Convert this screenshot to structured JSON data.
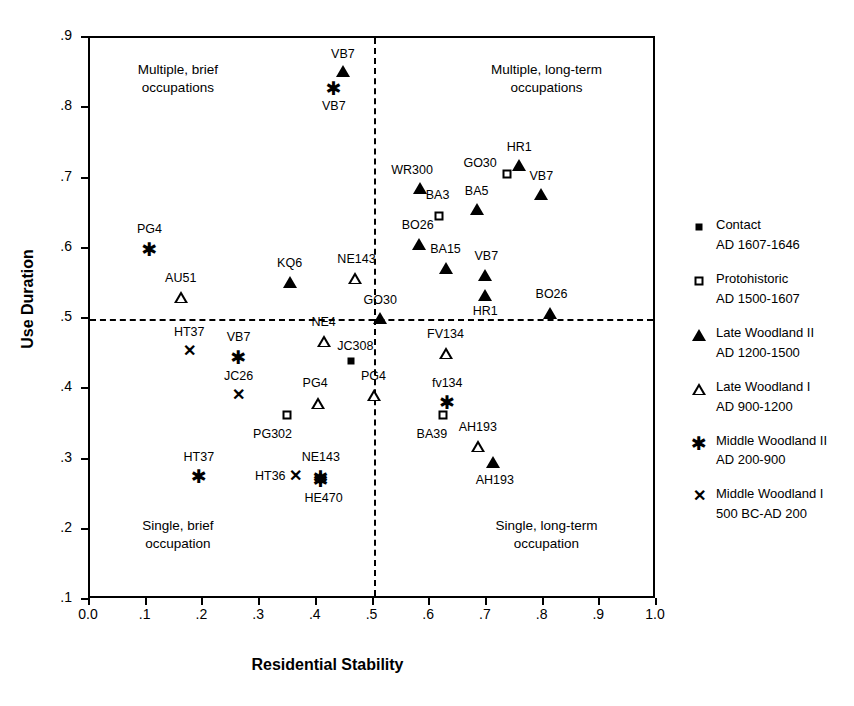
{
  "chart_data": {
    "type": "scatter",
    "title": "",
    "xlabel": "Residential Stability",
    "ylabel": "Use Duration",
    "xlim": [
      0.0,
      1.0
    ],
    "ylim": [
      0.1,
      0.9
    ],
    "grid": false,
    "xticks": [
      "0.0",
      ".1",
      ".2",
      ".3",
      ".4",
      ".5",
      ".6",
      ".7",
      ".8",
      ".9",
      "1.0"
    ],
    "xtick_values": [
      0.0,
      0.1,
      0.2,
      0.3,
      0.4,
      0.5,
      0.6,
      0.7,
      0.8,
      0.9,
      1.0
    ],
    "yticks": [
      ".1",
      ".2",
      ".3",
      ".4",
      ".5",
      ".6",
      ".7",
      ".8",
      ".9"
    ],
    "ytick_values": [
      0.1,
      0.2,
      0.3,
      0.4,
      0.5,
      0.6,
      0.7,
      0.8,
      0.9
    ],
    "reference_lines": {
      "vertical_x": 0.5,
      "horizontal_y": 0.5,
      "style": "dashed"
    },
    "quadrant_labels": [
      {
        "text": "Multiple, brief\noccupations",
        "x": 0.155,
        "y": 0.845
      },
      {
        "text": "Multiple, long-term\noccupations",
        "x": 0.805,
        "y": 0.845
      },
      {
        "text": "Single, brief\noccupation",
        "x": 0.155,
        "y": 0.195
      },
      {
        "text": "Single, long-term\noccupation",
        "x": 0.805,
        "y": 0.195
      }
    ],
    "legend": {
      "position": "right",
      "entries": [
        {
          "marker": "filled-square",
          "name": "Contact",
          "date": "AD 1607-1646"
        },
        {
          "marker": "open-square",
          "name": "Protohistoric",
          "date": "AD 1500-1607"
        },
        {
          "marker": "filled-triangle",
          "name": "Late Woodland II",
          "date": "AD 1200-1500"
        },
        {
          "marker": "open-triangle",
          "name": "Late Woodland I",
          "date": "AD 900-1200"
        },
        {
          "marker": "asterisk",
          "name": "Middle Woodland II",
          "date": "AD 200-900"
        },
        {
          "marker": "ex",
          "name": "Middle Woodland I",
          "date": "500 BC-AD 200"
        }
      ]
    },
    "points": [
      {
        "label": "VB7",
        "marker": "filled-triangle",
        "x": 0.446,
        "y": 0.853,
        "lx": 0.446,
        "ly": 0.877
      },
      {
        "label": "VB7",
        "marker": "asterisk",
        "x": 0.43,
        "y": 0.829,
        "lx": 0.43,
        "ly": 0.803
      },
      {
        "label": "HR1",
        "marker": "filled-triangle",
        "x": 0.757,
        "y": 0.719,
        "lx": 0.757,
        "ly": 0.745
      },
      {
        "label": "GO30",
        "marker": "open-square",
        "x": 0.735,
        "y": 0.706,
        "lx": 0.688,
        "ly": 0.722
      },
      {
        "label": "VB7",
        "marker": "filled-triangle",
        "x": 0.796,
        "y": 0.678,
        "lx": 0.796,
        "ly": 0.704
      },
      {
        "label": "WR300",
        "marker": "filled-triangle",
        "x": 0.582,
        "y": 0.686,
        "lx": 0.568,
        "ly": 0.712
      },
      {
        "label": "BA3",
        "marker": "open-square",
        "x": 0.616,
        "y": 0.646,
        "lx": 0.613,
        "ly": 0.676
      },
      {
        "label": "BA5",
        "marker": "filled-triangle",
        "x": 0.682,
        "y": 0.656,
        "lx": 0.682,
        "ly": 0.682
      },
      {
        "label": "BO26",
        "marker": "filled-triangle",
        "x": 0.58,
        "y": 0.607,
        "lx": 0.578,
        "ly": 0.634
      },
      {
        "label": "BA15",
        "marker": "filled-triangle",
        "x": 0.627,
        "y": 0.572,
        "lx": 0.627,
        "ly": 0.599
      },
      {
        "label": "VB7",
        "marker": "filled-triangle",
        "x": 0.697,
        "y": 0.562,
        "lx": 0.699,
        "ly": 0.589
      },
      {
        "label": "HR1",
        "marker": "filled-triangle",
        "x": 0.697,
        "y": 0.534,
        "lx": 0.697,
        "ly": 0.511
      },
      {
        "label": "BO26",
        "marker": "filled-triangle",
        "x": 0.812,
        "y": 0.509,
        "lx": 0.814,
        "ly": 0.536
      },
      {
        "label": "PG4",
        "marker": "asterisk",
        "x": 0.105,
        "y": 0.6,
        "lx": 0.105,
        "ly": 0.628
      },
      {
        "label": "AU51",
        "marker": "open-triangle",
        "x": 0.16,
        "y": 0.532,
        "lx": 0.16,
        "ly": 0.559
      },
      {
        "label": "KQ6",
        "marker": "filled-triangle",
        "x": 0.352,
        "y": 0.553,
        "lx": 0.352,
        "ly": 0.58
      },
      {
        "label": "NE143",
        "marker": "open-triangle",
        "x": 0.468,
        "y": 0.558,
        "lx": 0.47,
        "ly": 0.585
      },
      {
        "label": "GO30",
        "marker": "filled-triangle",
        "x": 0.512,
        "y": 0.501,
        "lx": 0.512,
        "ly": 0.527
      },
      {
        "label": "NE4",
        "marker": "open-triangle",
        "x": 0.412,
        "y": 0.469,
        "lx": 0.412,
        "ly": 0.496
      },
      {
        "label": "HT37",
        "marker": "ex",
        "x": 0.175,
        "y": 0.455,
        "lx": 0.175,
        "ly": 0.481
      },
      {
        "label": "VB7",
        "marker": "asterisk",
        "x": 0.262,
        "y": 0.446,
        "lx": 0.262,
        "ly": 0.474
      },
      {
        "label": "JC308",
        "marker": "filled-square",
        "x": 0.46,
        "y": 0.44,
        "lx": 0.468,
        "ly": 0.462
      },
      {
        "label": "FV134",
        "marker": "open-triangle",
        "x": 0.627,
        "y": 0.452,
        "lx": 0.627,
        "ly": 0.479
      },
      {
        "label": "JC26",
        "marker": "ex",
        "x": 0.262,
        "y": 0.392,
        "lx": 0.262,
        "ly": 0.419
      },
      {
        "label": "PG4",
        "marker": "open-triangle",
        "x": 0.5,
        "y": 0.392,
        "lx": 0.5,
        "ly": 0.419
      },
      {
        "label": "PG4",
        "marker": "open-triangle",
        "x": 0.402,
        "y": 0.38,
        "lx": 0.397,
        "ly": 0.409
      },
      {
        "label": "fv134",
        "marker": "asterisk",
        "x": 0.63,
        "y": 0.382,
        "lx": 0.63,
        "ly": 0.409
      },
      {
        "label": "PG302",
        "marker": "open-square",
        "x": 0.348,
        "y": 0.364,
        "lx": 0.322,
        "ly": 0.337
      },
      {
        "label": "BA39",
        "marker": "open-square",
        "x": 0.622,
        "y": 0.364,
        "lx": 0.603,
        "ly": 0.337
      },
      {
        "label": "AH193",
        "marker": "open-triangle",
        "x": 0.684,
        "y": 0.319,
        "lx": 0.684,
        "ly": 0.346
      },
      {
        "label": "AH193",
        "marker": "filled-triangle",
        "x": 0.71,
        "y": 0.297,
        "lx": 0.714,
        "ly": 0.271
      },
      {
        "label": "HT37",
        "marker": "asterisk",
        "x": 0.192,
        "y": 0.277,
        "lx": 0.192,
        "ly": 0.304
      },
      {
        "label": "HT36",
        "marker": "ex",
        "x": 0.363,
        "y": 0.276,
        "lx": 0.318,
        "ly": 0.276
      },
      {
        "label": "NE143",
        "marker": "asterisk",
        "x": 0.407,
        "y": 0.275,
        "lx": 0.407,
        "ly": 0.304
      },
      {
        "label": "HE470",
        "marker": "asterisk",
        "x": 0.407,
        "y": 0.271,
        "lx": 0.412,
        "ly": 0.245
      }
    ]
  }
}
